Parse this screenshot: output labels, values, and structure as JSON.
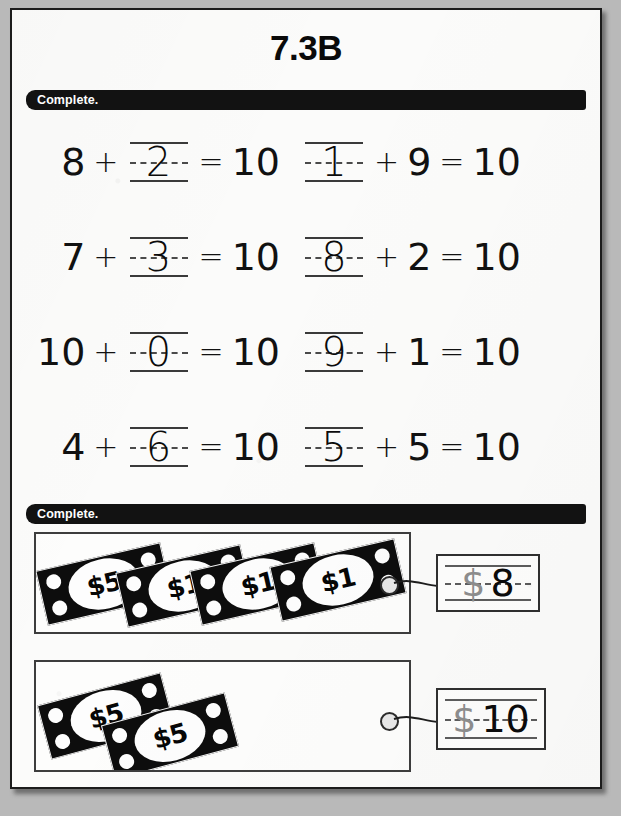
{
  "worksheet": {
    "title": "7.3B"
  },
  "sections": [
    {
      "instruction": "Complete."
    },
    {
      "instruction": "Complete."
    }
  ],
  "equations": {
    "rows": [
      {
        "left": {
          "a": "8",
          "op1": "+",
          "blank": "2",
          "eq": "=",
          "sum": "10",
          "blank_position": "second"
        },
        "right": {
          "blank": "1",
          "op1": "+",
          "b": "9",
          "eq": "=",
          "sum": "10",
          "blank_position": "first"
        }
      },
      {
        "left": {
          "a": "7",
          "op1": "+",
          "blank": "3",
          "eq": "=",
          "sum": "10",
          "blank_position": "second"
        },
        "right": {
          "blank": "8",
          "op1": "+",
          "b": "2",
          "eq": "=",
          "sum": "10",
          "blank_position": "first"
        }
      },
      {
        "left": {
          "a": "10",
          "op1": "+",
          "blank": "0",
          "eq": "=",
          "sum": "10",
          "blank_position": "second"
        },
        "right": {
          "blank": "9",
          "op1": "+",
          "b": "1",
          "eq": "=",
          "sum": "10",
          "blank_position": "first"
        }
      },
      {
        "left": {
          "a": "4",
          "op1": "+",
          "blank": "6",
          "eq": "=",
          "sum": "10",
          "blank_position": "second"
        },
        "right": {
          "blank": "5",
          "op1": "+",
          "b": "5",
          "eq": "=",
          "sum": "10",
          "blank_position": "first"
        }
      }
    ]
  },
  "money": {
    "rows": [
      {
        "bills": [
          {
            "label": "$5",
            "value": 5
          },
          {
            "label": "$1",
            "value": 1
          },
          {
            "label": "$1",
            "value": 1
          },
          {
            "label": "$1",
            "value": 1
          }
        ],
        "answer": {
          "currency": "$",
          "amount": "8"
        }
      },
      {
        "bills": [
          {
            "label": "$5",
            "value": 5
          },
          {
            "label": "$5",
            "value": 5
          }
        ],
        "answer": {
          "currency": "$",
          "amount": "10"
        }
      }
    ]
  },
  "colors": {
    "ink": "#111111",
    "banner_bg": "#121212",
    "banner_text": "#ffffff",
    "rule": "#3a3a3a",
    "preprinted_gray": "#8c8c8c",
    "page_bg": "#fbfbfa",
    "backdrop": "#b9b9b9"
  }
}
